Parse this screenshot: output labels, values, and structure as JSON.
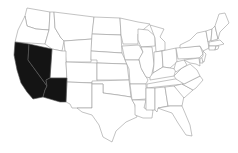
{
  "map": {
    "title": "United States map with highlighted states",
    "highlight_color": "#141414",
    "default_color": "#ffffff",
    "border_color": "#9a9a9a",
    "highlighted_states": [
      "California",
      "Nevada",
      "Arizona"
    ],
    "states": [
      {
        "name": "Washington",
        "highlighted": false,
        "points": "27,8 50,12 49,30 36,29 27,26 25,16"
      },
      {
        "name": "Oregon",
        "highlighted": false,
        "points": "25,16 27,26 36,29 49,30 45,44 15,42 18,30"
      },
      {
        "name": "California",
        "highlighted": true,
        "points": "15,42 29,44 28,60 47,86 45,90 43,97 33,99 27,92 21,83 17,70 14,55"
      },
      {
        "name": "Nevada",
        "highlighted": true,
        "points": "29,44 52,49 50,78 46,80 47,86 28,60"
      },
      {
        "name": "Idaho",
        "highlighted": false,
        "points": "50,12 54,12 55,28 61,38 64,41 62,51 52,49 45,44 49,30"
      },
      {
        "name": "Montana",
        "highlighted": false,
        "points": "54,12 94,17 92,39 64,41 61,38 55,28"
      },
      {
        "name": "Wyoming",
        "highlighted": false,
        "points": "64,41 92,39 91,62 66,62"
      },
      {
        "name": "Utah",
        "highlighted": false,
        "points": "52,49 62,51 66,51 66,62 67,78 50,78"
      },
      {
        "name": "Arizona",
        "highlighted": true,
        "points": "50,78 67,78 66,102 60,102 43,97 45,90 47,86 46,80"
      },
      {
        "name": "Colorado",
        "highlighted": false,
        "points": "66,62 97,63 97,83 67,82"
      },
      {
        "name": "New Mexico",
        "highlighted": false,
        "points": "67,82 92,83 92,108 72,108 70,104 66,102"
      },
      {
        "name": "North Dakota",
        "highlighted": false,
        "points": "94,17 120,18 121,35 92,34"
      },
      {
        "name": "South Dakota",
        "highlighted": false,
        "points": "92,34 121,35 122,53 91,51"
      },
      {
        "name": "Nebraska",
        "highlighted": false,
        "points": "91,51 122,53 127,64 97,63 97,60 91,60"
      },
      {
        "name": "Kansas",
        "highlighted": false,
        "points": "97,63 127,64 129,80 97,80"
      },
      {
        "name": "Oklahoma",
        "highlighted": false,
        "points": "92,81 129,80 131,97 118,95 103,93 103,84 92,84"
      },
      {
        "name": "Texas",
        "highlighted": false,
        "points": "92,84 103,84 103,93 118,95 131,97 135,105 137,117 126,122 116,131 112,142 103,137 99,125 92,115 82,112 77,108 92,108"
      },
      {
        "name": "Minnesota",
        "highlighted": false,
        "points": "120,18 138,22 150,24 138,34 138,44 123,44 121,35"
      },
      {
        "name": "Iowa",
        "highlighted": false,
        "points": "122,46 139,45 143,52 139,60 125,60"
      },
      {
        "name": "Missouri",
        "highlighted": false,
        "points": "125,60 139,60 142,70 148,80 146,84 130,84 129,69"
      },
      {
        "name": "Arkansas",
        "highlighted": false,
        "points": "130,84 146,84 146,99 132,100"
      },
      {
        "name": "Louisiana",
        "highlighted": false,
        "points": "132,100 146,100 144,108 153,110 152,118 143,118 135,115 135,105"
      },
      {
        "name": "Wisconsin",
        "highlighted": false,
        "points": "138,29 148,30 155,36 155,46 141,47 138,40"
      },
      {
        "name": "Illinois",
        "highlighted": false,
        "points": "141,47 152,47 154,64 151,78 146,77 141,68 139,59 143,52"
      },
      {
        "name": "Michigan",
        "highlighted": false,
        "points": "150,25 164,29 160,37 165,42 165,50 156,52 155,38"
      },
      {
        "name": "Indiana",
        "highlighted": false,
        "points": "154,52 162,51 163,67 153,73 154,64"
      },
      {
        "name": "Ohio",
        "highlighted": false,
        "points": "162,51 176,48 177,62 170,68 163,67"
      },
      {
        "name": "Kentucky",
        "highlighted": false,
        "points": "150,77 153,73 163,67 170,68 176,69 174,76 150,80"
      },
      {
        "name": "Tennessee",
        "highlighted": false,
        "points": "147,84 175,79 186,78 184,84 147,88"
      },
      {
        "name": "Mississippi",
        "highlighted": false,
        "points": "146,88 155,88 155,110 146,110 146,100"
      },
      {
        "name": "Alabama",
        "highlighted": false,
        "points": "155,88 165,87 168,106 158,108 157,112 155,110"
      },
      {
        "name": "Georgia",
        "highlighted": false,
        "points": "165,87 174,86 184,96 182,106 170,106 168,106"
      },
      {
        "name": "Florida",
        "highlighted": false,
        "points": "158,108 170,106 182,106 185,113 190,125 192,136 186,135 178,123 172,113 163,110"
      },
      {
        "name": "South Carolina",
        "highlighted": false,
        "points": "174,86 182,84 193,90 184,98"
      },
      {
        "name": "North Carolina",
        "highlighted": false,
        "points": "184,84 200,76 203,80 196,88 193,90 182,84"
      },
      {
        "name": "Virginia",
        "highlighted": false,
        "points": "174,76 182,68 190,64 197,70 200,76 184,84 176,79"
      },
      {
        "name": "West Virginia",
        "highlighted": false,
        "points": "176,62 184,60 187,65 182,68 176,72 174,69"
      },
      {
        "name": "Pennsylvania",
        "highlighted": false,
        "points": "176,48 200,46 203,54 199,58 178,59"
      },
      {
        "name": "New York",
        "highlighted": false,
        "points": "180,45 190,40 197,33 206,31 209,48 203,51 200,46 180,48"
      },
      {
        "name": "Maryland",
        "highlighted": false,
        "points": "184,60 199,58 200,66 196,64 190,63"
      },
      {
        "name": "New Jersey",
        "highlighted": false,
        "points": "203,51 206,54 204,62 200,60 203,56"
      },
      {
        "name": "Vermont",
        "highlighted": false,
        "points": "206,31 212,29 211,40 208,42"
      },
      {
        "name": "New Hampshire",
        "highlighted": false,
        "points": "212,29 215,26 218,39 211,41"
      },
      {
        "name": "Maine",
        "highlighted": false,
        "points": "215,26 219,14 225,13 229,23 220,32 218,39"
      },
      {
        "name": "Massachusetts",
        "highlighted": false,
        "points": "209,42 220,40 224,44 216,46 209,46"
      },
      {
        "name": "Connecticut",
        "highlighted": false,
        "points": "209,46 216,46 215,50 209,50"
      },
      {
        "name": "Rhode Island",
        "highlighted": false,
        "points": "216,46 219,46 218,49 215,50"
      },
      {
        "name": "Delaware",
        "highlighted": false,
        "points": "200,58 202,58 203,63 200,63"
      }
    ]
  }
}
